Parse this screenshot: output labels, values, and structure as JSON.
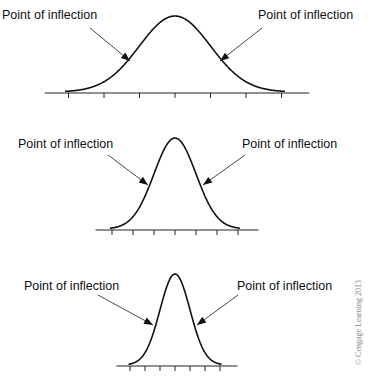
{
  "chart_data": [
    {
      "type": "line",
      "title": "Wide normal curve (large standard deviation)",
      "annotations": [
        "Point of inflection",
        "Point of inflection"
      ],
      "x_ticks": 7,
      "peak_x": 175,
      "axis_y": 93,
      "peak_y": 17,
      "sigma_px": 35.5,
      "left_label": "Point of inflection",
      "right_label": "Point of inflection"
    },
    {
      "type": "line",
      "title": "Medium normal curve",
      "annotations": [
        "Point of inflection",
        "Point of inflection"
      ],
      "x_ticks": 7,
      "peak_x": 175,
      "axis_y": 230,
      "peak_y": 139,
      "sigma_px": 21,
      "left_label": "Point of inflection",
      "right_label": "Point of inflection"
    },
    {
      "type": "line",
      "title": "Narrow normal curve (small standard deviation)",
      "annotations": [
        "Point of inflection",
        "Point of inflection"
      ],
      "x_ticks": 7,
      "peak_x": 175,
      "axis_y": 366,
      "peak_y": 275,
      "sigma_px": 15,
      "left_label": "Point of inflection",
      "right_label": "Point of inflection"
    }
  ],
  "labels": {
    "c1_left": "Point of inflection",
    "c1_right": "Point of inflection",
    "c2_left": "Point of inflection",
    "c2_right": "Point of inflection",
    "c3_left": "Point of inflection",
    "c3_right": "Point of inflection"
  },
  "copyright": "© Cengage Learning 2013"
}
